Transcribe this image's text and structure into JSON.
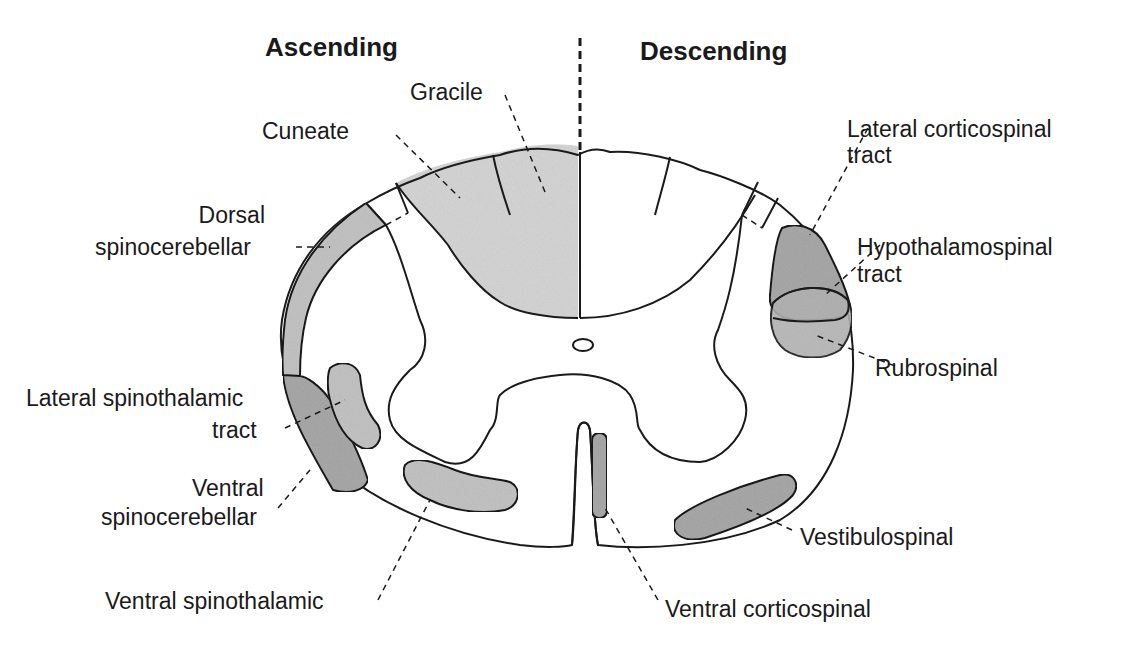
{
  "headers": {
    "ascending": "Ascending",
    "descending": "Descending"
  },
  "ascending_tracts": {
    "gracile": "Gracile",
    "cuneate": "Cuneate",
    "dorsal_spinocerebellar": [
      "Dorsal",
      "spinocerebellar"
    ],
    "lateral_spinothalamic": [
      "Lateral spinothalamic",
      "tract"
    ],
    "ventral_spinocerebellar": [
      "Ventral",
      "spinocerebellar"
    ],
    "ventral_spinothalamic": "Ventral spinothalamic"
  },
  "descending_tracts": {
    "lateral_corticospinal": [
      "Lateral corticospinal",
      "tract"
    ],
    "hypothalamospinal": [
      "Hypothalamospinal",
      "tract"
    ],
    "rubrospinal": "Rubrospinal",
    "vestibulospinal": "Vestibulospinal",
    "ventral_corticospinal": "Ventral corticospinal"
  },
  "colors": {
    "ink": "#1a1a1a",
    "light_shade": "#d6d6d6",
    "dark_shade": "#a9a9a9",
    "background": "#ffffff"
  }
}
